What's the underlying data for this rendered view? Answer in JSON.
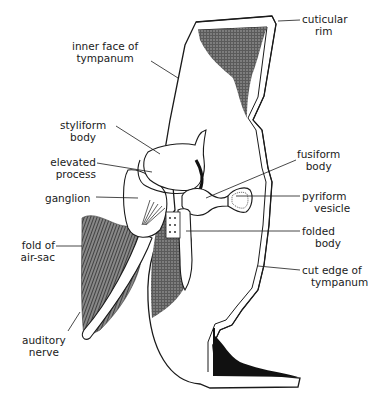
{
  "diagram": {
    "labels": {
      "inner_face": [
        "inner face of",
        "tympanum"
      ],
      "cuticular_rim": [
        "cuticular",
        "rim"
      ],
      "styliform_body": [
        "styliform",
        "body"
      ],
      "elevated_process": [
        "elevated",
        "process"
      ],
      "fusiform_body": [
        "fusiform",
        "body"
      ],
      "ganglion": [
        "ganglion"
      ],
      "pyriform_vesicle": [
        "pyriform",
        "vesicle"
      ],
      "fold_of_air_sac": [
        "fold of",
        "air-sac"
      ],
      "folded_body": [
        "folded",
        "body"
      ],
      "cut_edge": [
        "cut edge of",
        "tympanum"
      ],
      "auditory_nerve": [
        "auditory",
        "nerve"
      ]
    },
    "colors": {
      "ink": "#1a1a1a",
      "shade": "#3a3a3a",
      "background": "#ffffff"
    }
  }
}
